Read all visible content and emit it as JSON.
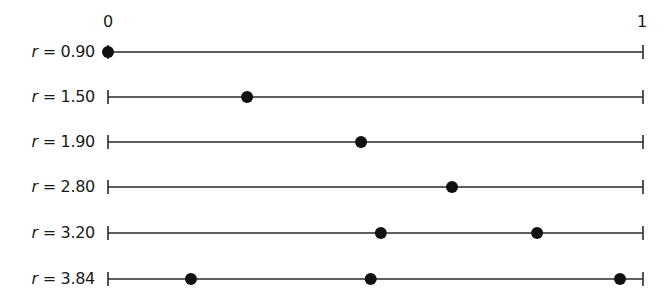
{
  "chart_data": {
    "type": "scatter",
    "title": "",
    "xlabel": "",
    "ylabel": "",
    "xlim": [
      0,
      1
    ],
    "grid": false,
    "legend": null,
    "axis_tick_labels": {
      "left": "0",
      "right": "1"
    },
    "rows": [
      {
        "var": "r",
        "eq": " = ",
        "value": "0.90",
        "points": [
          0.0
        ]
      },
      {
        "var": "r",
        "eq": " = ",
        "value": "1.50",
        "points": [
          0.26
        ]
      },
      {
        "var": "r",
        "eq": " = ",
        "value": "1.90",
        "points": [
          0.473
        ]
      },
      {
        "var": "r",
        "eq": " = ",
        "value": "2.80",
        "points": [
          0.643
        ]
      },
      {
        "var": "r",
        "eq": " = ",
        "value": "3.20",
        "points": [
          0.51,
          0.802
        ]
      },
      {
        "var": "r",
        "eq": " = ",
        "value": "3.84",
        "points": [
          0.155,
          0.491,
          0.957
        ]
      }
    ],
    "colors": {
      "line": "#2a2a2a",
      "dot": "#111111"
    }
  }
}
